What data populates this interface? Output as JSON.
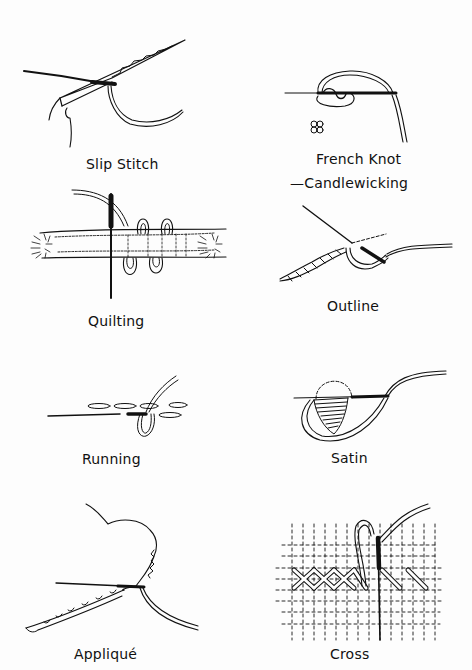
{
  "page": {
    "ink_color": "#111111",
    "paper_color": "#fdfdfd"
  },
  "stitches": [
    {
      "id": "slip-stitch",
      "label": "Slip Stitch",
      "icon": "slip-stitch-illustration"
    },
    {
      "id": "french-knot",
      "label": "French Knot",
      "sublabel": "—Candlewicking",
      "icon": "french-knot-illustration"
    },
    {
      "id": "quilting",
      "label": "Quilting",
      "icon": "quilting-illustration"
    },
    {
      "id": "outline",
      "label": "Outline",
      "icon": "outline-stitch-illustration"
    },
    {
      "id": "running",
      "label": "Running",
      "icon": "running-stitch-illustration"
    },
    {
      "id": "satin",
      "label": "Satin",
      "icon": "satin-stitch-illustration"
    },
    {
      "id": "applique",
      "label": "Appliqué",
      "icon": "applique-illustration"
    },
    {
      "id": "cross",
      "label": "Cross",
      "icon": "cross-stitch-illustration"
    }
  ]
}
